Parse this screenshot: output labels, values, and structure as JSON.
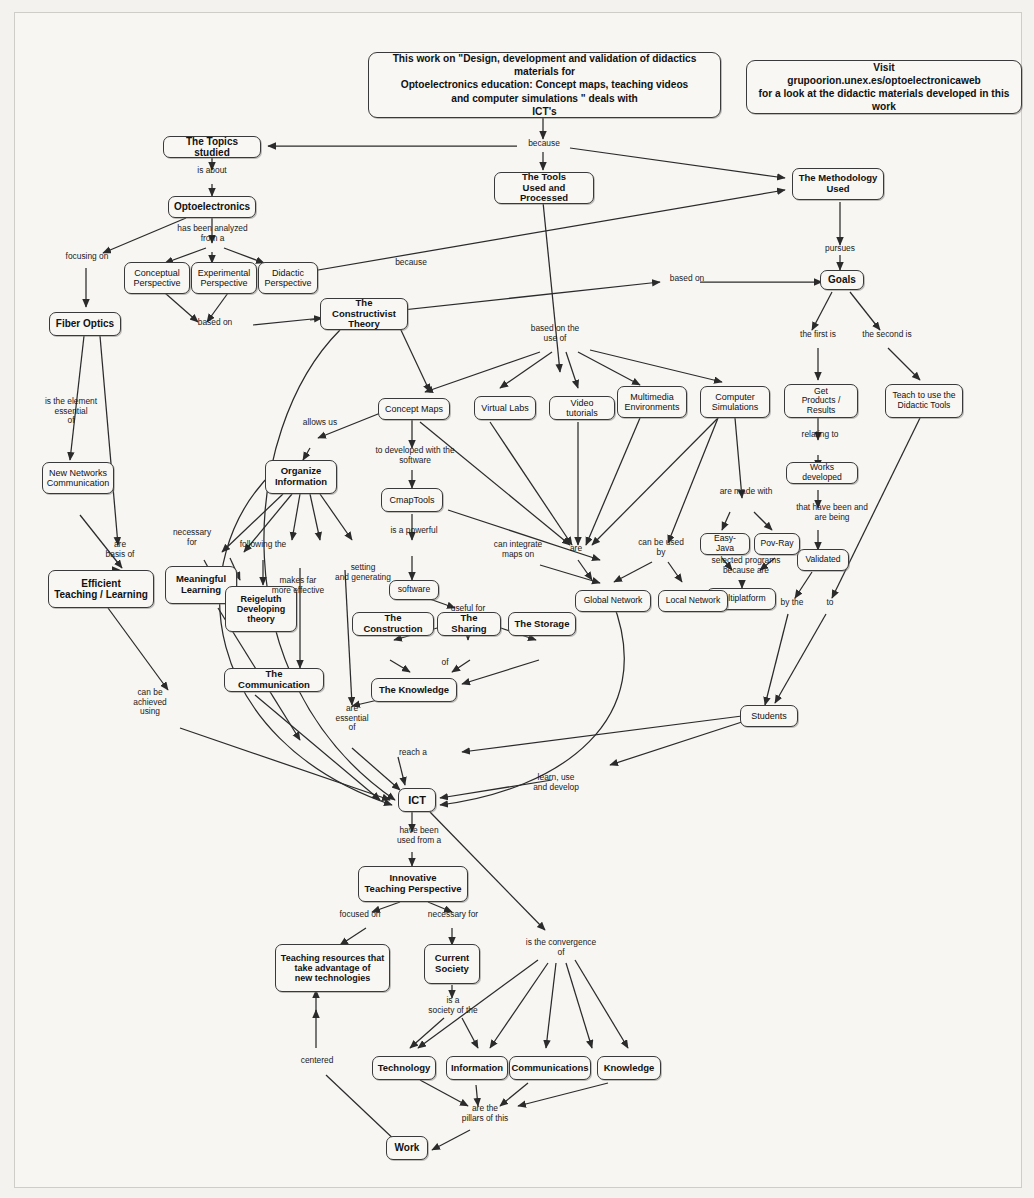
{
  "page": {
    "background_color": "#f3f2ef",
    "paper_color": "#f7f6f3",
    "node_border_color": "#3a3a3a",
    "text_color": "#111111"
  },
  "banners": [
    {
      "name": "work-statement-banner",
      "lines": [
        "This work on \"Design, development and validation of didactics materials for",
        "Optoelectronics education: Concept maps, teaching videos",
        "and computer simulations \" deals with",
        "ICT's"
      ]
    },
    {
      "name": "visit-banner",
      "lines": [
        "Visit",
        "grupoorion.unex.es/optoelectronicaweb",
        "for a look at the didactic materials developed in this work"
      ]
    }
  ],
  "nodes": [
    {
      "id": "topics",
      "label": "The Topics studied",
      "bold": true
    },
    {
      "id": "optoelectronics",
      "label": "Optoelectronics",
      "bold": true
    },
    {
      "id": "conceptual",
      "label": "Conceptual\nPerspective",
      "bold": false
    },
    {
      "id": "experimental",
      "label": "Experimental\nPerspective",
      "bold": false
    },
    {
      "id": "didactic",
      "label": "Didactic\nPerspective",
      "bold": false
    },
    {
      "id": "fiber",
      "label": "Fiber Optics",
      "bold": true
    },
    {
      "id": "newnetworks",
      "label": "New Networks\nCommunication",
      "bold": false
    },
    {
      "id": "efficient",
      "label": "Efficient\nTeaching / Learning",
      "bold": true
    },
    {
      "id": "tools",
      "label": "The Tools\nUsed and Processed",
      "bold": true
    },
    {
      "id": "methodology",
      "label": "The Methodology\nUsed",
      "bold": true
    },
    {
      "id": "goals",
      "label": "Goals",
      "bold": true
    },
    {
      "id": "constructivist",
      "label": "The Constructivist\nTheory",
      "bold": true
    },
    {
      "id": "conceptmaps",
      "label": "Concept Maps",
      "bold": false
    },
    {
      "id": "virtuallabs",
      "label": "Virtual Labs",
      "bold": false
    },
    {
      "id": "videotutorials",
      "label": "Video tutorials",
      "bold": false
    },
    {
      "id": "multimedia",
      "label": "Multimedia\nEnvironments",
      "bold": false
    },
    {
      "id": "simulations",
      "label": "Computer\nSimulations",
      "bold": false
    },
    {
      "id": "getproducts",
      "label": "Get\nProducts / Results",
      "bold": false
    },
    {
      "id": "teachtools",
      "label": "Teach to use the\nDidactic Tools",
      "bold": false
    },
    {
      "id": "worksdev",
      "label": "Works developed",
      "bold": false
    },
    {
      "id": "validated",
      "label": "Validated",
      "bold": false
    },
    {
      "id": "easyjava",
      "label": "Easy-Java",
      "bold": false
    },
    {
      "id": "povray",
      "label": "Pov-Ray",
      "bold": false
    },
    {
      "id": "multiplatform",
      "label": "Multiplatform",
      "bold": false
    },
    {
      "id": "organize",
      "label": "Organize\nInformation",
      "bold": true
    },
    {
      "id": "cmaptools",
      "label": "CmapTools",
      "bold": false
    },
    {
      "id": "software",
      "label": "software",
      "bold": false
    },
    {
      "id": "globalnet",
      "label": "Global Network",
      "bold": false
    },
    {
      "id": "localnet",
      "label": "Local Network",
      "bold": false
    },
    {
      "id": "meaningful",
      "label": "Meaningful\nLearning",
      "bold": true
    },
    {
      "id": "reigeluth",
      "label": "Reigeluth\nDeveloping\ntheory",
      "bold": true
    },
    {
      "id": "communication",
      "label": "The Communication",
      "bold": true
    },
    {
      "id": "construction",
      "label": "The Construction",
      "bold": true
    },
    {
      "id": "sharing",
      "label": "The Sharing",
      "bold": true
    },
    {
      "id": "storage",
      "label": "The Storage",
      "bold": true
    },
    {
      "id": "knowledgebox",
      "label": "The Knowledge",
      "bold": true
    },
    {
      "id": "students",
      "label": "Students",
      "bold": false
    },
    {
      "id": "ict",
      "label": "ICT",
      "bold": true
    },
    {
      "id": "innovative",
      "label": "Innovative\nTeaching Perspective",
      "bold": true
    },
    {
      "id": "teachres",
      "label": "Teaching resources that\ntake advantage of\nnew technologies",
      "bold": true
    },
    {
      "id": "society",
      "label": "Current\nSociety",
      "bold": true
    },
    {
      "id": "technology",
      "label": "Technology",
      "bold": true
    },
    {
      "id": "information",
      "label": "Information",
      "bold": true
    },
    {
      "id": "communications",
      "label": "Communications",
      "bold": true
    },
    {
      "id": "knowledge",
      "label": "Knowledge",
      "bold": true
    },
    {
      "id": "work",
      "label": "Work",
      "bold": true
    }
  ],
  "link_labels": [
    {
      "id": "lbl-because-top",
      "text": "because"
    },
    {
      "id": "lbl-is-about",
      "text": "is about"
    },
    {
      "id": "lbl-has-been",
      "text": "has been analyzed\nfrom a"
    },
    {
      "id": "lbl-focusing-on",
      "text": "focusing on"
    },
    {
      "id": "lbl-based-on-1",
      "text": "based on"
    },
    {
      "id": "lbl-because-2",
      "text": "because"
    },
    {
      "id": "lbl-pursues",
      "text": "pursues"
    },
    {
      "id": "lbl-based-on-2",
      "text": "based on"
    },
    {
      "id": "lbl-based-on-use",
      "text": "based on the\nuse of"
    },
    {
      "id": "lbl-first-is",
      "text": "the first is"
    },
    {
      "id": "lbl-second-is",
      "text": "the second is"
    },
    {
      "id": "lbl-is-element",
      "text": "is the element\nessential\nof"
    },
    {
      "id": "lbl-allows-us",
      "text": "allows us"
    },
    {
      "id": "lbl-developed-sw",
      "text": "to developed with the\nsoftware"
    },
    {
      "id": "lbl-relating-to",
      "text": "relating to"
    },
    {
      "id": "lbl-made-with",
      "text": "are made with"
    },
    {
      "id": "lbl-is-powerful",
      "text": "is a powerful"
    },
    {
      "id": "lbl-can-integrate",
      "text": "can integrate\nmaps on"
    },
    {
      "id": "lbl-are",
      "text": "are"
    },
    {
      "id": "lbl-can-be-used",
      "text": "can be used\nby"
    },
    {
      "id": "lbl-selected-prog",
      "text": "selected programs\nbecause are"
    },
    {
      "id": "lbl-that-have-been",
      "text": "that have been and\nare being"
    },
    {
      "id": "lbl-are-basis",
      "text": "are\nbasis of"
    },
    {
      "id": "lbl-necessary-for",
      "text": "necessary\nfor"
    },
    {
      "id": "lbl-following-the",
      "text": "following the"
    },
    {
      "id": "lbl-makes-far",
      "text": "makes far\nmore effective"
    },
    {
      "id": "lbl-setting",
      "text": "setting\nand generating"
    },
    {
      "id": "lbl-useful-for",
      "text": "useful for"
    },
    {
      "id": "lbl-of",
      "text": "of"
    },
    {
      "id": "lbl-by-the",
      "text": "by the"
    },
    {
      "id": "lbl-to",
      "text": "to"
    },
    {
      "id": "lbl-can-be-achieved",
      "text": "can be\nachieved\nusing"
    },
    {
      "id": "lbl-are-essential",
      "text": "are\nessential\nof"
    },
    {
      "id": "lbl-reach-a",
      "text": "reach a"
    },
    {
      "id": "lbl-learn-use",
      "text": "learn, use\nand develop"
    },
    {
      "id": "lbl-have-been-used",
      "text": "have been\nused from a"
    },
    {
      "id": "lbl-focused-on",
      "text": "focused on"
    },
    {
      "id": "lbl-necessary-for-2",
      "text": "necessary for"
    },
    {
      "id": "lbl-convergence",
      "text": "is  the convergence\nof"
    },
    {
      "id": "lbl-is-a-society",
      "text": "is a\nsociety of the"
    },
    {
      "id": "lbl-centered",
      "text": "centered"
    },
    {
      "id": "lbl-pillars",
      "text": "are the\npillars of this"
    }
  ]
}
